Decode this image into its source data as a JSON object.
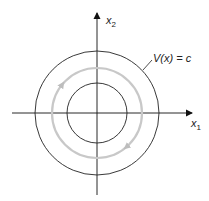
{
  "diagram": {
    "type": "lyapunov-level-sets",
    "center": [
      97,
      113
    ],
    "axes": {
      "x_label": "x",
      "x_sub": "1",
      "y_label": "x",
      "y_sub": "2",
      "color": "#111111"
    },
    "circles": [
      {
        "name": "outer-level-set",
        "r": 62,
        "color": "#222222",
        "width": 0.9
      },
      {
        "name": "trajectory",
        "r": 45,
        "color": "#c8c8c8",
        "width": 2.2
      },
      {
        "name": "inner-level-set",
        "r": 30,
        "color": "#222222",
        "width": 0.9
      }
    ],
    "trajectory_direction": "clockwise (assumed; arrowheads too faint to confirm)",
    "level_set_label": "V(x) = c",
    "colors": {
      "background": "#ffffff",
      "ink": "#222222",
      "trajectory": "#c8c8c8"
    }
  }
}
